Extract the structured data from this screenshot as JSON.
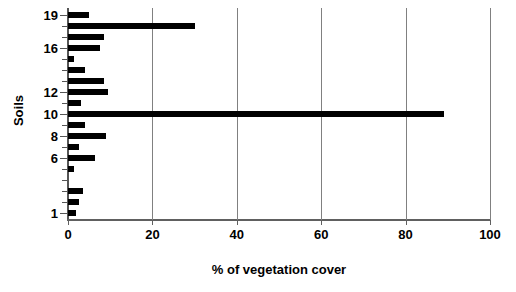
{
  "chart_data": {
    "type": "bar",
    "orientation": "horizontal",
    "title": "",
    "xlabel": "% of vegetation cover",
    "ylabel": "Soils",
    "xlim": [
      0,
      100
    ],
    "ylim": [
      0.4,
      19.6
    ],
    "grid": "vertical",
    "legend": "none",
    "bar_color": "#000000",
    "xticks": [
      0,
      20,
      40,
      60,
      80,
      100
    ],
    "xtick_labels": [
      "0",
      "20",
      "40",
      "60",
      "80",
      "100"
    ],
    "yticks": [
      1,
      2,
      3,
      4,
      5,
      6,
      7,
      8,
      9,
      10,
      11,
      12,
      13,
      14,
      15,
      16,
      17,
      18,
      19
    ],
    "ytick_labels_shown": [
      "1",
      "6",
      "8",
      "10",
      "12",
      "16",
      "19"
    ],
    "categories": [
      1,
      2,
      3,
      4,
      5,
      6,
      7,
      8,
      9,
      10,
      11,
      12,
      13,
      14,
      15,
      16,
      17,
      18,
      19
    ],
    "values": [
      2.0,
      2.5,
      3.5,
      0.0,
      1.5,
      6.5,
      2.5,
      9.0,
      4.0,
      89.0,
      3.0,
      9.5,
      8.5,
      4.0,
      1.5,
      7.5,
      8.5,
      30.0,
      5.0
    ],
    "points": [
      {
        "soil": 1,
        "percent": 2.0
      },
      {
        "soil": 2,
        "percent": 2.5
      },
      {
        "soil": 3,
        "percent": 3.5
      },
      {
        "soil": 4,
        "percent": 0.0
      },
      {
        "soil": 5,
        "percent": 1.5
      },
      {
        "soil": 6,
        "percent": 6.5
      },
      {
        "soil": 7,
        "percent": 2.5
      },
      {
        "soil": 8,
        "percent": 9.0
      },
      {
        "soil": 9,
        "percent": 4.0
      },
      {
        "soil": 10,
        "percent": 89.0
      },
      {
        "soil": 11,
        "percent": 3.0
      },
      {
        "soil": 12,
        "percent": 9.5
      },
      {
        "soil": 13,
        "percent": 8.5
      },
      {
        "soil": 14,
        "percent": 4.0
      },
      {
        "soil": 15,
        "percent": 1.5
      },
      {
        "soil": 16,
        "percent": 7.5
      },
      {
        "soil": 17,
        "percent": 8.5
      },
      {
        "soil": 18,
        "percent": 30.0
      },
      {
        "soil": 19,
        "percent": 5.0
      }
    ]
  }
}
